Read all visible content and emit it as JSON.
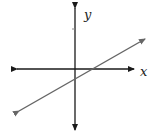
{
  "diagram": {
    "type": "coordinate-plane-with-line",
    "x_axis_label": "x",
    "y_axis_label": "y",
    "colors": {
      "axes": "#1a1a1a",
      "line": "#666666",
      "background": "#ffffff"
    }
  }
}
